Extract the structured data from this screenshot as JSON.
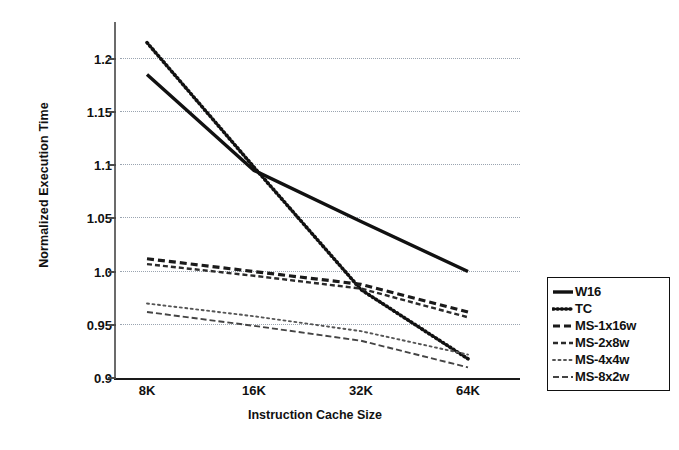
{
  "chart_data": {
    "type": "line",
    "title": "",
    "xlabel": "Instruction Cache Size",
    "ylabel": "Normalized Execution Time",
    "categories": [
      "8K",
      "16K",
      "32K",
      "64K"
    ],
    "ylim": [
      0.9,
      1.225
    ],
    "yticks": [
      "0.9",
      "0.95",
      "1.0",
      "1.05",
      "1.1",
      "1.15",
      "1.2"
    ],
    "ytick_values": [
      0.9,
      0.95,
      1.0,
      1.05,
      1.1,
      1.15,
      1.2
    ],
    "grid": "horizontal-dotted",
    "legend_position": "right-outside",
    "series": [
      {
        "name": "W16",
        "style": "solid",
        "values": [
          1.185,
          1.095,
          1.047,
          1.0
        ]
      },
      {
        "name": "TC",
        "style": "dotted",
        "values": [
          1.215,
          1.098,
          0.983,
          0.918
        ]
      },
      {
        "name": "MS-1x16w",
        "style": "dashed",
        "values": [
          1.012,
          1.0,
          0.988,
          0.962
        ]
      },
      {
        "name": "MS-2x8w",
        "style": "fine-dash",
        "values": [
          1.007,
          0.996,
          0.984,
          0.957
        ]
      },
      {
        "name": "MS-4x4w",
        "style": "sparse-dot",
        "values": [
          0.97,
          0.958,
          0.944,
          0.922
        ]
      },
      {
        "name": "MS-8x2w",
        "style": "dash-dot",
        "values": [
          0.962,
          0.949,
          0.935,
          0.91
        ]
      }
    ],
    "colors": {
      "W16": "#111111",
      "TC": "#111111",
      "MS-1x16w": "#1a1a1a",
      "MS-2x8w": "#2b2b2b",
      "MS-4x4w": "#555555",
      "MS-8x2w": "#444444",
      "gridline": "#9aa4b0",
      "axis": "#4a4a4a",
      "background": "#ffffff"
    }
  },
  "legend": {
    "items": [
      {
        "label": "W16"
      },
      {
        "label": "TC"
      },
      {
        "label": "MS-1x16w"
      },
      {
        "label": "MS-2x8w"
      },
      {
        "label": "MS-4x4w"
      },
      {
        "label": "MS-8x2w"
      }
    ]
  }
}
